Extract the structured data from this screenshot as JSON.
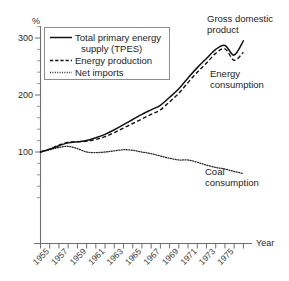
{
  "chart_data": {
    "type": "line",
    "title": "",
    "subtitle": "",
    "xlabel": "Year",
    "ylabel": "%",
    "xlim": [
      1954,
      1976.5
    ],
    "ylim": [
      0,
      320
    ],
    "yticks": [
      100,
      200,
      300
    ],
    "ytick_labels": [
      "100",
      "200",
      "300"
    ],
    "yticks_minor_step": 20,
    "xticks": [
      1954,
      1955,
      1956,
      1957,
      1958,
      1959,
      1960,
      1961,
      1962,
      1963,
      1964,
      1965,
      1966,
      1967,
      1968,
      1969,
      1970,
      1971,
      1972,
      1973,
      1974,
      1975,
      1976
    ],
    "xtick_labels": [
      "1955",
      "1957",
      "1959",
      "1961",
      "1963",
      "1965",
      "1967",
      "1969",
      "1971",
      "1973",
      "1975"
    ],
    "xtick_label_years": [
      1955,
      1957,
      1959,
      1961,
      1963,
      1965,
      1967,
      1969,
      1971,
      1973,
      1975
    ],
    "xtick_label_rotation": -45,
    "grid": false,
    "legend_position": "upper-left-inside",
    "x": [
      1954,
      1955,
      1956,
      1957,
      1958,
      1959,
      1960,
      1961,
      1962,
      1963,
      1964,
      1965,
      1966,
      1967,
      1968,
      1969,
      1970,
      1971,
      1972,
      1973,
      1974,
      1975,
      1976
    ],
    "series": [
      {
        "name": "Total primary energy supply (TPES)",
        "style": "solid",
        "values": [
          100,
          105,
          111,
          116,
          118,
          120,
          125,
          131,
          139,
          148,
          157,
          166,
          174,
          182,
          196,
          211,
          230,
          248,
          264,
          280,
          287,
          270,
          295
        ]
      },
      {
        "name": "Energy production",
        "style": "dashed",
        "values": [
          100,
          105,
          112,
          117,
          118,
          119,
          122,
          127,
          134,
          142,
          150,
          158,
          166,
          174,
          188,
          203,
          222,
          240,
          256,
          273,
          281,
          261,
          275
        ]
      },
      {
        "name": "Net imports",
        "style": "dotted",
        "values": [
          100,
          104,
          108,
          110,
          106,
          100,
          99,
          100,
          102,
          104,
          103,
          100,
          97,
          93,
          89,
          86,
          86,
          82,
          77,
          73,
          70,
          66,
          62
        ]
      }
    ],
    "annotations": [
      {
        "text": "Gross domestic product",
        "lines": [
          "Gross domestic",
          "product"
        ],
        "x": 0.72,
        "y": 0.04
      },
      {
        "text": "Energy consumption",
        "lines": [
          "Energy",
          "consumption"
        ],
        "x": 0.72,
        "y": 0.25
      },
      {
        "text": "Coal consumption",
        "lines": [
          "Coal",
          "consumption"
        ],
        "x": 0.7,
        "y": 0.6
      }
    ]
  },
  "legend": {
    "entries": [
      {
        "label_line1": "Total primary energy",
        "label_line2": "supply (TPES)",
        "style": "solid"
      },
      {
        "label_line1": "Energy production",
        "label_line2": "",
        "style": "dashed"
      },
      {
        "label_line1": "Net imports",
        "label_line2": "",
        "style": "dotted"
      }
    ]
  },
  "axes": {
    "y_unit_label": "%",
    "x_axis_title": "Year",
    "ytick_100": "100",
    "ytick_200": "200",
    "ytick_300": "300"
  },
  "xlabels": {
    "y1955": "1955",
    "y1957": "1957",
    "y1959": "1959",
    "y1961": "1961",
    "y1963": "1963",
    "y1965": "1965",
    "y1967": "1967",
    "y1969": "1969",
    "y1971": "1971",
    "y1973": "1973",
    "y1975": "1975"
  },
  "annotations": {
    "gdp_line1": "Gross domestic",
    "gdp_line2": "product",
    "energy_line1": "Energy",
    "energy_line2": "consumption",
    "coal_line1": "Coal",
    "coal_line2": "consumption"
  },
  "colors": {
    "ink": "#111111",
    "axis": "#6e6e6e",
    "background": "#ffffff"
  }
}
